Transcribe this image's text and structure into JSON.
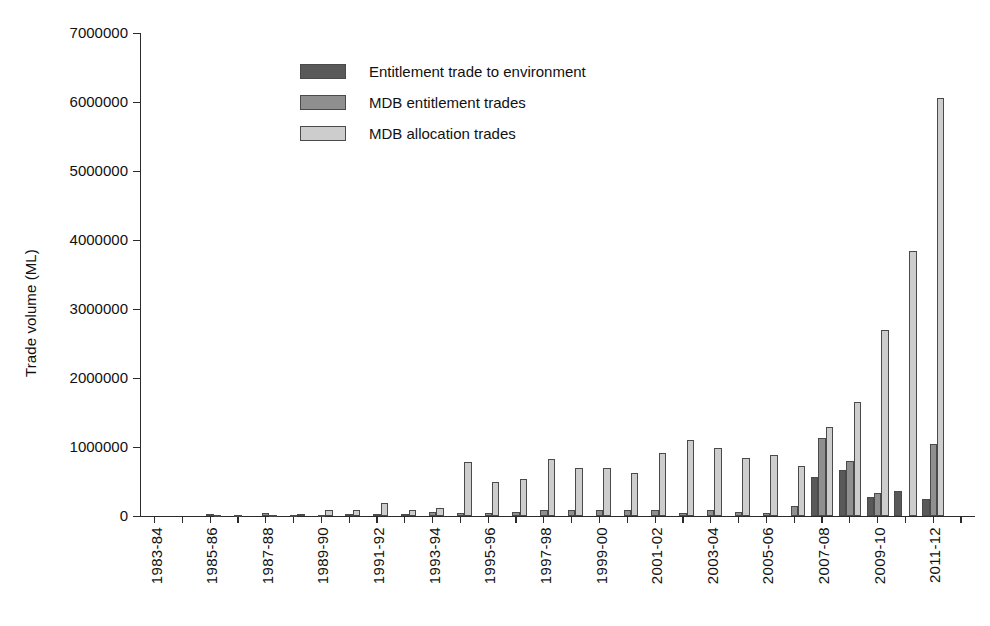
{
  "chart_data": {
    "type": "bar",
    "title": "",
    "xlabel": "",
    "ylabel": "Trade volume (ML)",
    "ylim": [
      0,
      7000000
    ],
    "ytick_labels": [
      "0",
      "1000000",
      "2000000",
      "3000000",
      "4000000",
      "5000000",
      "6000000",
      "7000000"
    ],
    "ytick_values": [
      0,
      1000000,
      2000000,
      3000000,
      4000000,
      5000000,
      6000000,
      7000000
    ],
    "grid": false,
    "legend_position": "upper-center-left",
    "categories": [
      "1983-84",
      "1984-85",
      "1985-86",
      "1986-87",
      "1987-88",
      "1988-89",
      "1989-90",
      "1990-91",
      "1991-92",
      "1992-93",
      "1993-94",
      "1994-95",
      "1995-96",
      "1996-97",
      "1997-98",
      "1998-99",
      "1999-00",
      "2000-01",
      "2001-02",
      "2002-03",
      "2003-04",
      "2004-05",
      "2005-06",
      "2006-07",
      "2007-08",
      "2008-09",
      "2009-10",
      "2010-11",
      "2011-12",
      "2012-13"
    ],
    "xtick_labels_shown": [
      "1983-84",
      "1985-86",
      "1987-88",
      "1989-90",
      "1991-92",
      "1993-94",
      "1995-96",
      "1997-98",
      "1999-00",
      "2001-02",
      "2003-04",
      "2005-06",
      "2007-08",
      "2009-10",
      "2011-12"
    ],
    "series": [
      {
        "name": "Entitlement trade to environment",
        "color": "#595959",
        "values": [
          0,
          0,
          0,
          0,
          0,
          0,
          0,
          0,
          0,
          0,
          0,
          0,
          0,
          0,
          0,
          0,
          0,
          0,
          0,
          0,
          0,
          0,
          0,
          0,
          560000,
          670000,
          270000,
          360000,
          240000,
          0
        ]
      },
      {
        "name": "MDB entitlement trades",
        "color": "#8f8f8f",
        "values": [
          0,
          0,
          30000,
          20000,
          40000,
          20000,
          20000,
          30000,
          30000,
          30000,
          60000,
          50000,
          50000,
          60000,
          80000,
          80000,
          80000,
          80000,
          90000,
          50000,
          80000,
          60000,
          50000,
          140000,
          1130000,
          790000,
          330000,
          0,
          1050000,
          0
        ]
      },
      {
        "name": "MDB allocation trades",
        "color": "#cdcdcd",
        "values": [
          0,
          0,
          20000,
          0,
          20000,
          30000,
          90000,
          80000,
          190000,
          90000,
          110000,
          780000,
          500000,
          540000,
          820000,
          700000,
          690000,
          630000,
          920000,
          1100000,
          990000,
          840000,
          880000,
          730000,
          1290000,
          1650000,
          2700000,
          3840000,
          6060000,
          0
        ]
      }
    ]
  },
  "legend": {
    "items": [
      {
        "label": "Entitlement trade to environment"
      },
      {
        "label": "MDB entitlement trades"
      },
      {
        "label": "MDB allocation trades"
      }
    ]
  },
  "axes": {
    "y_title": "Trade volume (ML)"
  }
}
